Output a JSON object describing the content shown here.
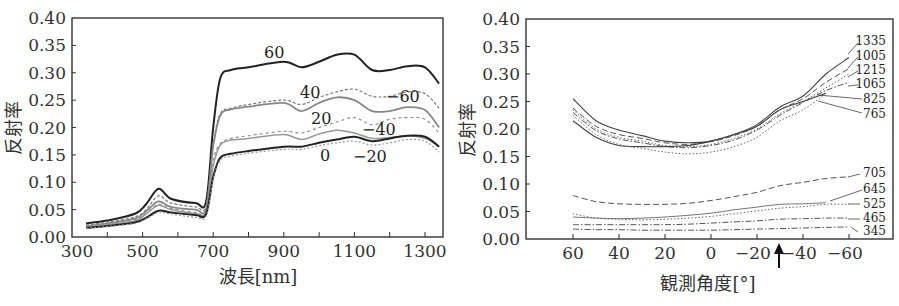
{
  "chart_data": [
    {
      "type": "line",
      "title": "",
      "xlabel": "波長[nm]",
      "ylabel": "反射率",
      "xlim": [
        300,
        1350
      ],
      "ylim": [
        0.0,
        0.4
      ],
      "xticks": [
        "300",
        "500",
        "700",
        "900",
        "1100",
        "1300"
      ],
      "yticks": [
        "0.00",
        "0.05",
        "0.10",
        "0.15",
        "0.20",
        "0.25",
        "0.30",
        "0.35",
        "0.40"
      ],
      "grid": false,
      "legend": "inline curve labels",
      "x": [
        340,
        400,
        480,
        510,
        545,
        580,
        650,
        680,
        700,
        720,
        750,
        800,
        900,
        950,
        1000,
        1050,
        1100,
        1150,
        1200,
        1250,
        1300,
        1340
      ],
      "series": [
        {
          "name": "60",
          "style": "solid-dark",
          "values": [
            0.025,
            0.03,
            0.043,
            0.06,
            0.088,
            0.07,
            0.062,
            0.065,
            0.2,
            0.29,
            0.305,
            0.31,
            0.32,
            0.31,
            0.32,
            0.333,
            0.333,
            0.305,
            0.305,
            0.312,
            0.31,
            0.28
          ]
        },
        {
          "name": "40",
          "style": "dotted-gray",
          "values": [
            0.022,
            0.027,
            0.037,
            0.05,
            0.075,
            0.062,
            0.055,
            0.057,
            0.17,
            0.225,
            0.235,
            0.242,
            0.25,
            0.242,
            0.255,
            0.265,
            0.27,
            0.257,
            0.257,
            0.265,
            0.262,
            0.235
          ]
        },
        {
          "name": "20",
          "style": "solid-gray",
          "values": [
            0.02,
            0.025,
            0.034,
            0.047,
            0.065,
            0.055,
            0.05,
            0.052,
            0.165,
            0.222,
            0.233,
            0.238,
            0.245,
            0.23,
            0.245,
            0.255,
            0.25,
            0.23,
            0.23,
            0.237,
            0.232,
            0.2
          ]
        },
        {
          "name": "-60",
          "style": "dashed-gray",
          "values": [
            0.02,
            0.024,
            0.032,
            0.043,
            0.06,
            0.052,
            0.045,
            0.048,
            0.14,
            0.17,
            0.18,
            0.185,
            0.193,
            0.19,
            0.2,
            0.21,
            0.218,
            0.205,
            0.215,
            0.218,
            0.215,
            0.19
          ]
        },
        {
          "name": "-40",
          "style": "solid-light",
          "values": [
            0.019,
            0.023,
            0.03,
            0.042,
            0.058,
            0.05,
            0.043,
            0.046,
            0.13,
            0.168,
            0.177,
            0.18,
            0.187,
            0.178,
            0.188,
            0.195,
            0.19,
            0.18,
            0.182,
            0.185,
            0.18,
            0.165
          ]
        },
        {
          "name": "0",
          "style": "solid-dark",
          "values": [
            0.017,
            0.02,
            0.027,
            0.035,
            0.048,
            0.045,
            0.04,
            0.042,
            0.11,
            0.145,
            0.152,
            0.157,
            0.165,
            0.165,
            0.172,
            0.178,
            0.183,
            0.175,
            0.18,
            0.185,
            0.183,
            0.165
          ]
        },
        {
          "name": "-20",
          "style": "dotted-light",
          "values": [
            0.016,
            0.019,
            0.025,
            0.033,
            0.045,
            0.042,
            0.036,
            0.038,
            0.105,
            0.14,
            0.148,
            0.153,
            0.16,
            0.16,
            0.167,
            0.172,
            0.175,
            0.168,
            0.172,
            0.178,
            0.175,
            0.155
          ]
        }
      ]
    },
    {
      "type": "line",
      "title": "",
      "xlabel": "観測角度[°]",
      "ylabel": "反射率",
      "xlim": [
        80,
        -80
      ],
      "ylim": [
        0.0,
        0.4
      ],
      "xticks": [
        "60",
        "40",
        "20",
        "0",
        "−20",
        "−40",
        "−60"
      ],
      "yticks": [
        "0.00",
        "0.05",
        "0.10",
        "0.15",
        "0.20",
        "0.25",
        "0.30",
        "0.35",
        "0.40"
      ],
      "grid": false,
      "annotation": {
        "type": "arrow",
        "x": -30,
        "note": "upward arrow below x-axis between −20 and −40"
      },
      "legend": "inline labels at right",
      "x": [
        60,
        50,
        40,
        30,
        20,
        10,
        0,
        -10,
        -20,
        -30,
        -40,
        -50,
        -60
      ],
      "series": [
        {
          "name": "1335",
          "style": "solid",
          "values": [
            0.255,
            0.215,
            0.198,
            0.188,
            0.178,
            0.175,
            0.178,
            0.19,
            0.208,
            0.24,
            0.26,
            0.3,
            0.33
          ]
        },
        {
          "name": "1005",
          "style": "dashed",
          "values": [
            0.238,
            0.205,
            0.19,
            0.183,
            0.175,
            0.172,
            0.177,
            0.188,
            0.205,
            0.235,
            0.255,
            0.285,
            0.31
          ]
        },
        {
          "name": "1215",
          "style": "dotted",
          "values": [
            0.235,
            0.2,
            0.185,
            0.178,
            0.17,
            0.168,
            0.172,
            0.183,
            0.2,
            0.228,
            0.25,
            0.275,
            0.3
          ]
        },
        {
          "name": "1065",
          "style": "dash-dot",
          "values": [
            0.23,
            0.197,
            0.182,
            0.175,
            0.168,
            0.166,
            0.17,
            0.18,
            0.198,
            0.225,
            0.248,
            0.27,
            0.285
          ]
        },
        {
          "name": "825",
          "style": "solid",
          "values": [
            0.215,
            0.185,
            0.17,
            0.168,
            0.168,
            0.17,
            0.178,
            0.19,
            0.205,
            0.235,
            0.25,
            0.265,
            null
          ]
        },
        {
          "name": "765",
          "style": "dotted",
          "values": [
            0.225,
            0.19,
            0.172,
            0.165,
            0.158,
            0.155,
            0.158,
            0.168,
            0.185,
            0.215,
            0.235,
            0.265,
            null
          ]
        },
        {
          "name": "705",
          "style": "dashed",
          "values": [
            0.079,
            0.068,
            0.064,
            0.063,
            0.063,
            0.065,
            0.07,
            0.077,
            0.085,
            0.097,
            0.103,
            0.11,
            0.113
          ]
        },
        {
          "name": "645",
          "style": "solid-thin",
          "values": [
            0.04,
            0.038,
            0.037,
            0.038,
            0.04,
            0.043,
            0.047,
            0.053,
            0.058,
            0.063,
            0.064,
            0.066,
            null
          ]
        },
        {
          "name": "525",
          "style": "dotted",
          "values": [
            0.046,
            0.038,
            0.036,
            0.035,
            0.036,
            0.038,
            0.041,
            0.046,
            0.051,
            0.056,
            0.059,
            0.063,
            0.063
          ]
        },
        {
          "name": "465",
          "style": "dash-dot",
          "values": [
            0.026,
            0.026,
            0.026,
            0.026,
            0.026,
            0.027,
            0.029,
            0.031,
            0.033,
            0.036,
            0.037,
            0.038,
            0.038
          ]
        },
        {
          "name": "345",
          "style": "dash-dot",
          "values": [
            0.018,
            0.017,
            0.017,
            0.016,
            0.016,
            0.016,
            0.016,
            0.017,
            0.018,
            0.019,
            0.02,
            0.021,
            0.022
          ]
        }
      ]
    }
  ],
  "left_chart": {
    "ylabel": "反射率",
    "xlabel": "波長[nm]",
    "yticks": [
      "0.00",
      "0.05",
      "0.10",
      "0.15",
      "0.20",
      "0.25",
      "0.30",
      "0.35",
      "0.40"
    ],
    "xticks": [
      "300",
      "500",
      "700",
      "900",
      "1100",
      "1300"
    ],
    "curve_labels": [
      "60",
      "40",
      "20",
      "0",
      "−60",
      "−40",
      "−20"
    ]
  },
  "right_chart": {
    "ylabel": "反射率",
    "xlabel": "観測角度[°]",
    "yticks": [
      "0.00",
      "0.05",
      "0.10",
      "0.15",
      "0.20",
      "0.25",
      "0.30",
      "0.35",
      "0.40"
    ],
    "xticks": [
      "60",
      "40",
      "20",
      "0",
      "−20",
      "−40",
      "−60"
    ],
    "curve_labels": [
      "1335",
      "1005",
      "1215",
      "1065",
      "825",
      "765",
      "705",
      "645",
      "525",
      "465",
      "345"
    ]
  }
}
